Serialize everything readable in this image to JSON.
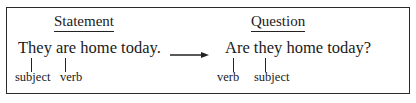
{
  "diagram": {
    "statement": {
      "heading": "Statement",
      "sentence": "They are home today.",
      "labels": [
        "subject",
        "verb"
      ]
    },
    "question": {
      "heading": "Question",
      "sentence": "Are they home today?",
      "labels": [
        "verb",
        "subject"
      ]
    },
    "connector": "arrow-right"
  }
}
